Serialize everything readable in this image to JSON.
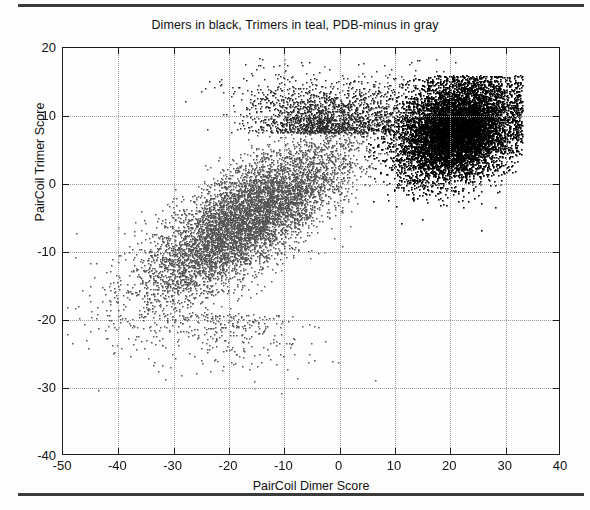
{
  "figure": {
    "title": "Dimers in black, Trimers in teal, PDB-minus in gray",
    "background_color": "#fdfdfd",
    "frame_color": "#1a1a1a",
    "grid_color": "#9a9a9a"
  },
  "rules": {
    "top_rule_name": "top-divider",
    "bottom_rule_name": "bottom-divider"
  },
  "axes": {
    "xlabel": "PairCoil Dimer Score",
    "ylabel": "PairCoil Trimer Score",
    "xticks": [
      "-50",
      "-40",
      "-30",
      "-20",
      "-10",
      "0",
      "10",
      "20",
      "30",
      "40"
    ],
    "yticks": [
      "20",
      "10",
      "0",
      "-10",
      "-20",
      "-30",
      "-40"
    ]
  },
  "chart_data": {
    "type": "scatter",
    "title": "Dimers in black, Trimers in teal, PDB-minus in gray",
    "xlabel": "PairCoil Dimer Score",
    "ylabel": "PairCoil Trimer Score",
    "xlim": [
      -50,
      40
    ],
    "ylim": [
      -40,
      20
    ],
    "xticks": [
      -50,
      -40,
      -30,
      -20,
      -10,
      0,
      10,
      20,
      30,
      40
    ],
    "yticks": [
      -40,
      -30,
      -20,
      -10,
      0,
      10,
      20
    ],
    "grid": true,
    "grid_style": "dotted",
    "legend": "in-title",
    "legend_entries": [
      {
        "name": "Dimers",
        "color": "#000000",
        "描述": "black"
      },
      {
        "name": "Trimers",
        "color": "#1f1f1f",
        "描述": "teal"
      },
      {
        "name": "PDB-minus",
        "color": "#555555",
        "描述": "gray"
      }
    ],
    "series": [
      {
        "name": "PDB-minus",
        "color": "#555555",
        "marker": "square",
        "marker_size": 1.5,
        "n_points": 7000,
        "distribution": "diagonal-band",
        "center": [
          -17,
          -5
        ],
        "spread": [
          9.5,
          6.0
        ],
        "correlation": 0.78,
        "seed": 17
      },
      {
        "name": "Trimers",
        "color": "#2a2a2a",
        "marker": "square",
        "marker_size": 1.5,
        "n_points": 1800,
        "distribution": "upper-diagonal-tail",
        "center": [
          -2,
          9
        ],
        "spread": [
          7.5,
          4.5
        ],
        "correlation": 0.5,
        "seed": 91
      },
      {
        "name": "Dimers",
        "color": "#000000",
        "marker": "square",
        "marker_size": 1.6,
        "n_points": 9000,
        "distribution": "dense-blob",
        "center": [
          21,
          8
        ],
        "spread": [
          5.2,
          3.6
        ],
        "correlation": 0.22,
        "seed": 43
      },
      {
        "name": "PDB-minus-outliers",
        "color": "#555555",
        "marker": "square",
        "marker_size": 1.5,
        "n_points": 320,
        "distribution": "sparse-lower",
        "center": [
          -22,
          -19
        ],
        "spread": [
          8.0,
          5.5
        ],
        "correlation": 0.35,
        "seed": 5
      }
    ]
  }
}
